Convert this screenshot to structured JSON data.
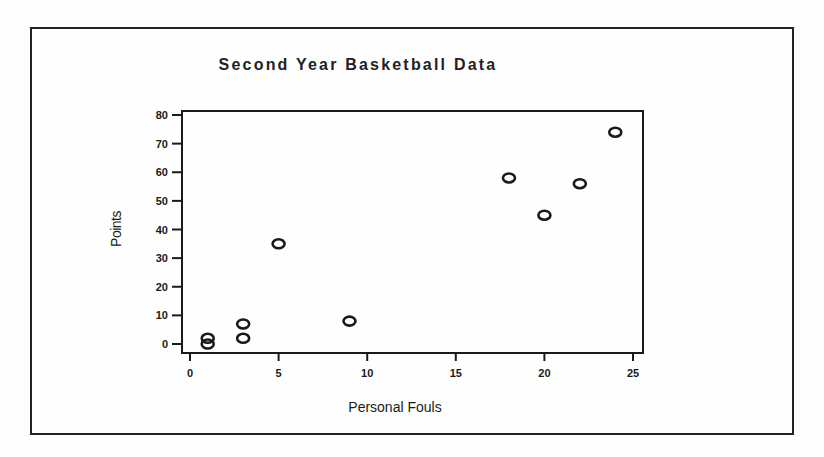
{
  "chart_data": {
    "type": "scatter",
    "title": "Second Year Basketball Data",
    "xlabel": "Personal Fouls",
    "ylabel": "Points",
    "xlim": [
      0,
      25
    ],
    "ylim": [
      0,
      80
    ],
    "xticks": [
      0,
      5,
      10,
      15,
      20,
      25
    ],
    "yticks": [
      0,
      10,
      20,
      30,
      40,
      50,
      60,
      70,
      80
    ],
    "grid": false,
    "legend": null,
    "marker": "open-circle",
    "points": [
      {
        "x": 1,
        "y": 0
      },
      {
        "x": 1,
        "y": 2
      },
      {
        "x": 3,
        "y": 2
      },
      {
        "x": 3,
        "y": 7
      },
      {
        "x": 5,
        "y": 35
      },
      {
        "x": 9,
        "y": 8
      },
      {
        "x": 18,
        "y": 58
      },
      {
        "x": 20,
        "y": 45
      },
      {
        "x": 22,
        "y": 56
      },
      {
        "x": 24,
        "y": 74
      }
    ]
  },
  "colors": {
    "ink": "#1a1a1a",
    "background": "#fdfdfd"
  }
}
